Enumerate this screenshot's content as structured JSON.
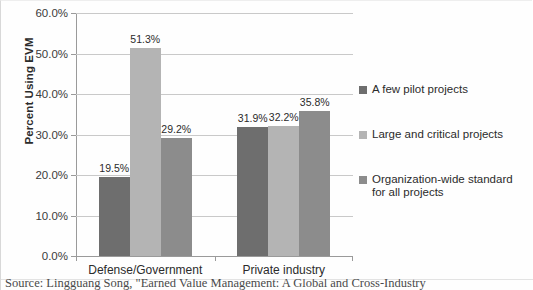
{
  "chart_data": {
    "type": "bar",
    "title": "",
    "xlabel": "",
    "ylabel": "Percent Using EVM",
    "ylim": [
      0,
      60
    ],
    "ytick_labels": [
      "0.0%",
      "10.0%",
      "20.0%",
      "30.0%",
      "40.0%",
      "50.0%",
      "60.0%"
    ],
    "ytick_values": [
      0,
      10,
      20,
      30,
      40,
      50,
      60
    ],
    "grid": true,
    "legend_position": "right",
    "categories": [
      "Defense/Government",
      "Private industry"
    ],
    "series": [
      {
        "name": "A few pilot projects",
        "color": "#6e6e6e",
        "values": [
          19.5,
          31.9
        ],
        "labels": [
          "19.5%",
          "31.9%"
        ]
      },
      {
        "name": "Large and critical projects",
        "color": "#b4b4b4",
        "values": [
          51.3,
          32.2
        ],
        "labels": [
          "51.3%",
          "32.2%"
        ]
      },
      {
        "name": "Organization-wide standard for all projects",
        "color": "#8c8c8c",
        "values": [
          29.2,
          35.8
        ],
        "labels": [
          "29.2%",
          "35.8%"
        ]
      }
    ]
  },
  "legend": {
    "entries": [
      {
        "label": "A few pilot projects",
        "color": "#6e6e6e"
      },
      {
        "label": "Large and critical projects",
        "color": "#b4b4b4"
      },
      {
        "label": "Organization-wide standard\nfor all projects",
        "color": "#8c8c8c"
      }
    ]
  },
  "caption": {
    "source_text": "Source: Lingguang Song, \"Earned Value Management: A Global and Cross-Industry"
  }
}
